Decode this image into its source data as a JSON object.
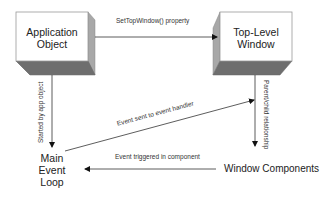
{
  "diagram": {
    "nodes": {
      "app_object": {
        "line1": "Application",
        "line2": "Object"
      },
      "top_level_window": {
        "line1": "Top-Level",
        "line2": "Window"
      },
      "main_event_loop": {
        "line1": "Main",
        "line2": "Event",
        "line3": "Loop"
      },
      "window_components": {
        "label": "Window Components"
      }
    },
    "edges": {
      "set_top_window": {
        "label": "SetTopWindow() property"
      },
      "started_by_app": {
        "label": "Started by app object"
      },
      "parent_child": {
        "label": "Parent/child relationship"
      },
      "event_sent": {
        "label": "Event sent to event handler"
      },
      "event_triggered": {
        "label": "Event triggered in component"
      }
    },
    "colors": {
      "box_face": "#ffffff",
      "box_side": "#a8a8a8",
      "box_bottom": "#6e6e6e",
      "line": "#333333"
    }
  }
}
